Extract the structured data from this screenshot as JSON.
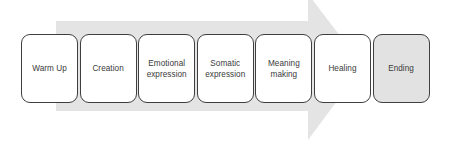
{
  "diagram": {
    "type": "process-arrow",
    "title": "",
    "arrow": {
      "name": "process-flow-arrow",
      "direction": "right",
      "color": "#e4e4e4"
    },
    "colors": {
      "box_border": "#3f3f3f",
      "box_fill": "#ffffff",
      "box_fill_highlight": "#e2e2e2",
      "arrow_fill": "#e4e4e4",
      "text": "#3a3a3a",
      "background": "#ffffff"
    },
    "stages": [
      {
        "label": "Warm Up",
        "highlighted": false
      },
      {
        "label": "Creation",
        "highlighted": false
      },
      {
        "label": "Emotional\nexpression",
        "highlighted": false
      },
      {
        "label": "Somatic\nexpression",
        "highlighted": false
      },
      {
        "label": "Meaning\nmaking",
        "highlighted": false
      },
      {
        "label": "Healing",
        "highlighted": false
      },
      {
        "label": "Ending",
        "highlighted": true
      }
    ]
  }
}
